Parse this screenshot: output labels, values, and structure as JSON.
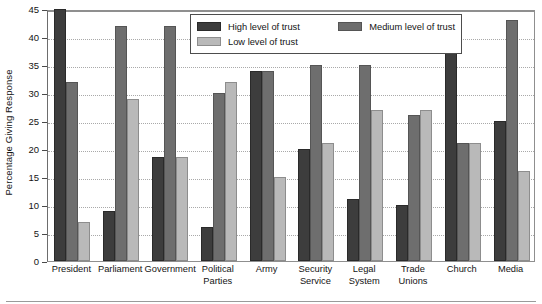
{
  "chart_data": {
    "type": "bar",
    "title": "",
    "subtitle": "",
    "xlabel": "",
    "ylabel": "Percentage Giving Response",
    "ylim": [
      0,
      45
    ],
    "ytick_step": 5,
    "yticks": [
      0,
      5,
      10,
      15,
      20,
      25,
      30,
      35,
      40,
      45
    ],
    "grid": true,
    "grid_axis": "y",
    "grid_style": "dotted",
    "legend_position": "top-center-inside",
    "categories": [
      "President",
      "Parliament",
      "Government",
      "Political Parties",
      "Army",
      "Security Service",
      "Legal System",
      "Trade Unions",
      "Church",
      "Media"
    ],
    "category_lines": [
      [
        "President"
      ],
      [
        "Parliament"
      ],
      [
        "Government"
      ],
      [
        "Political",
        "Parties"
      ],
      [
        "Army"
      ],
      [
        "Security",
        "Service"
      ],
      [
        "Legal",
        "System"
      ],
      [
        "Trade",
        "Unions"
      ],
      [
        "Church"
      ],
      [
        "Media"
      ]
    ],
    "series": [
      {
        "name": "High level of trust",
        "color": "#3d3d3d",
        "values": [
          45,
          9,
          18.5,
          6,
          34,
          20,
          11,
          10,
          38,
          25
        ]
      },
      {
        "name": "Medium level of trust",
        "color": "#6e6e6e",
        "values": [
          32,
          42,
          42,
          30,
          34,
          35,
          35,
          26,
          21,
          43
        ]
      },
      {
        "name": "Low level of trust",
        "color": "#b9b9b9",
        "values": [
          7,
          29,
          18.5,
          32,
          15,
          21,
          27,
          27,
          21,
          16
        ]
      }
    ]
  },
  "legend": {
    "entries": [
      {
        "label": "High level of trust",
        "swatch": "s0"
      },
      {
        "label": "Medium level of trust",
        "swatch": "s1"
      },
      {
        "label": "Low level of trust",
        "swatch": "s2"
      }
    ]
  },
  "axis": {
    "y_title": "Percentage Giving Response"
  }
}
